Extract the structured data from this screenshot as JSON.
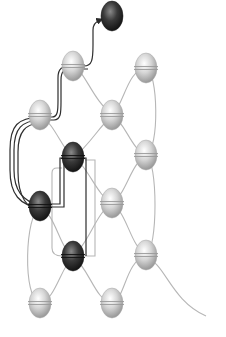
{
  "diagram": {
    "colors": {
      "background": "#ffffff",
      "bead_light": "#c8c8c8",
      "bead_dark": "#2a2a2a",
      "thread_base": "#b4b4b4",
      "thread_highlight": "#303030"
    },
    "beads": [
      {
        "id": "b-top",
        "tone": "dark",
        "col": 2,
        "row": 0
      },
      {
        "id": "b1",
        "tone": "light",
        "col": 1,
        "row": 1
      },
      {
        "id": "b2",
        "tone": "light",
        "col": 3,
        "row": 1
      },
      {
        "id": "b3",
        "tone": "light",
        "col": 0,
        "row": 2
      },
      {
        "id": "b4",
        "tone": "light",
        "col": 2,
        "row": 2
      },
      {
        "id": "b5",
        "tone": "dark",
        "col": 1,
        "row": 3
      },
      {
        "id": "b6",
        "tone": "light",
        "col": 3,
        "row": 3
      },
      {
        "id": "b7",
        "tone": "dark",
        "col": 0,
        "row": 4
      },
      {
        "id": "b8",
        "tone": "light",
        "col": 2,
        "row": 4
      },
      {
        "id": "b9",
        "tone": "dark",
        "col": 1,
        "row": 5
      },
      {
        "id": "b10",
        "tone": "light",
        "col": 3,
        "row": 5
      },
      {
        "id": "b11",
        "tone": "light",
        "col": 0,
        "row": 6
      },
      {
        "id": "b12",
        "tone": "light",
        "col": 2,
        "row": 6
      }
    ],
    "highlighted_path_arrow": "arrow-up-right"
  }
}
